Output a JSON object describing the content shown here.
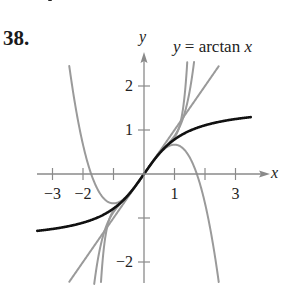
{
  "problem_number": "38.",
  "chart_data": {
    "type": "line",
    "title": "",
    "annotation": "y = arctan x",
    "xlabel": "x",
    "ylabel": "y",
    "xlim": [
      -3.5,
      3.9
    ],
    "ylim": [
      -2.5,
      2.5
    ],
    "x_ticks": [
      -3,
      -2,
      -1,
      1,
      2,
      3
    ],
    "x_tick_labels": [
      "−3",
      "−2",
      "1",
      "3"
    ],
    "x_tick_label_positions": [
      -3,
      -2,
      1,
      3
    ],
    "y_ticks": [
      -2,
      -1,
      1,
      2
    ],
    "y_tick_labels": [
      "2",
      "1",
      "−2"
    ],
    "y_tick_label_positions": [
      2,
      1,
      -2
    ],
    "grid": false,
    "series": [
      {
        "name": "y = arctan x",
        "color": "#111111",
        "function": "arctan(x)",
        "x_range": [
          -3.5,
          3.5
        ],
        "width": 2.6
      },
      {
        "name": "P1(x) = x",
        "color": "#9a9a9a",
        "function": "x",
        "x_range": [
          -2.45,
          2.45
        ]
      },
      {
        "name": "P3(x) = x − x^3/3",
        "color": "#9a9a9a",
        "function": "x - x^3/3",
        "x_range": [
          -2.45,
          2.95
        ]
      },
      {
        "name": "P5(x) = x − x^3/3 + x^5/5",
        "color": "#9a9a9a",
        "function": "x - x^3/3 + x^5/5",
        "x_range": [
          -1.7,
          1.7
        ]
      },
      {
        "name": "P9(x)",
        "color": "#9a9a9a",
        "function": "x - x^3/3 + x^5/5 - x^7/7 + x^9/9",
        "x_range": [
          -1.5,
          1.5
        ]
      }
    ]
  }
}
